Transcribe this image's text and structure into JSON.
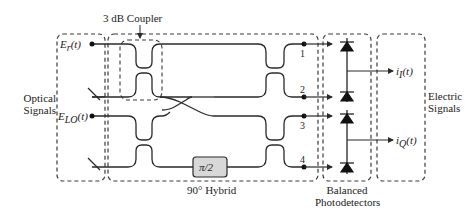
{
  "diagram": {
    "groups": {
      "optical_signals": "Optical Signals",
      "optical_signals_line1": "Optical",
      "optical_signals_line2": "Signals",
      "hybrid": "90° Hybrid",
      "coupler": "3 dB Coupler",
      "photodetectors_line1": "Balanced",
      "photodetectors_line2": "Photodetectors",
      "electric_signals_line1": "Electric",
      "electric_signals_line2": "Signals"
    },
    "inputs": {
      "signal": "E_r(t)",
      "signal_base": "E",
      "signal_sub": "r",
      "signal_arg": "(t)",
      "lo": "E_LO(t)",
      "lo_base": "E",
      "lo_sub": "LO",
      "lo_arg": "(t)"
    },
    "phase_shifter": "π/2",
    "ports": [
      "1",
      "2",
      "3",
      "4"
    ],
    "outputs": {
      "in_phase": "i_I(t)",
      "in_phase_base": "i",
      "in_phase_sub": "I",
      "in_phase_arg": "(t)",
      "quadrature": "i_Q(t)",
      "quadrature_base": "i",
      "quadrature_sub": "Q",
      "quadrature_arg": "(t)"
    },
    "colors": {
      "line": "#2a2a2a",
      "dash": "#3a3a3a",
      "phase_box_fill": "#d8d8d8"
    }
  }
}
